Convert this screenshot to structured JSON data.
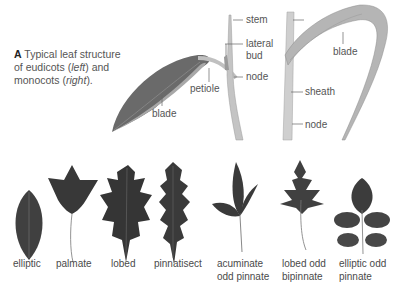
{
  "caption": {
    "letter": "A",
    "text_1": " Typical leaf structure of eudicots (",
    "left": "left",
    "text_2": ") and monocots (",
    "right": "right",
    "text_3": ")."
  },
  "eudicot_labels": {
    "stem": "stem",
    "lateral_bud_1": "lateral",
    "lateral_bud_2": "bud",
    "node": "node",
    "petiole": "petiole",
    "blade": "blade"
  },
  "monocot_labels": {
    "blade": "blade",
    "sheath": "sheath",
    "node": "node"
  },
  "leaf_shapes": [
    {
      "line1": "elliptic",
      "line2": ""
    },
    {
      "line1": "palmate",
      "line2": ""
    },
    {
      "line1": "lobed",
      "line2": ""
    },
    {
      "line1": "pinnatisect",
      "line2": ""
    },
    {
      "line1": "acuminate",
      "line2": "odd pinnate"
    },
    {
      "line1": "lobed odd",
      "line2": "bipinnate"
    },
    {
      "line1": "elliptic odd",
      "line2": "pinnate"
    }
  ],
  "colors": {
    "leaf_dark": "#3a3a3a",
    "leaf_gray": "#6e6e6e",
    "stem": "#bdbdbd",
    "text": "#4a4a4a"
  }
}
